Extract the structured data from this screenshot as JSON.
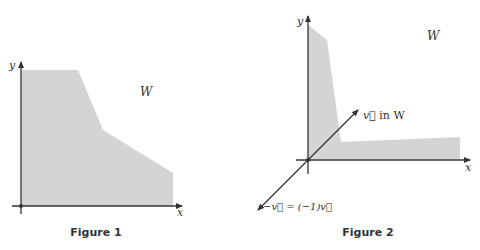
{
  "colors": {
    "region_fill": "#d4d4d4",
    "axis": "#333333",
    "text": "#333333"
  },
  "figure1": {
    "caption": "Figure 1",
    "x_axis_label": "x",
    "y_axis_label": "y",
    "region_label": "W"
  },
  "figure2": {
    "caption": "Figure 2",
    "x_axis_label": "x",
    "y_axis_label": "y",
    "region_label": "W",
    "vector_label_prefix": "v⃗",
    "vector_label_suffix": " in W",
    "neg_vector_label": "−v⃗ = (−1)v⃗"
  }
}
